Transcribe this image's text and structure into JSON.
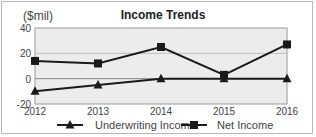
{
  "chart_data": {
    "type": "line",
    "title": "Income Trends",
    "unit_label": "($mil)",
    "xlabel": "",
    "ylabel": "($mil)",
    "categories": [
      "2012",
      "2013",
      "2014",
      "2015",
      "2016"
    ],
    "ylim": [
      -20,
      40
    ],
    "yticks": [
      "40",
      "20",
      "0",
      "-20"
    ],
    "grid": true,
    "legend_position": "bottom",
    "series": [
      {
        "name": "Underwriting Income",
        "marker": "triangle",
        "values": [
          -10,
          -5,
          0,
          0,
          0
        ]
      },
      {
        "name": "Net Income",
        "marker": "square",
        "values": [
          14,
          12,
          25,
          3,
          27
        ]
      }
    ]
  }
}
